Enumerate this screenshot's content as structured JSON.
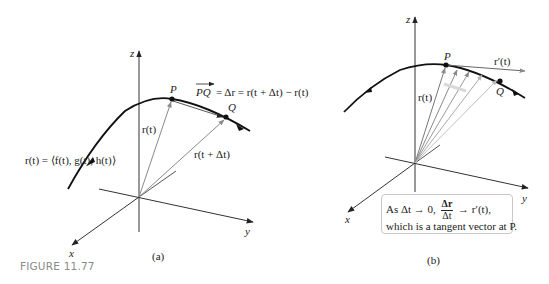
{
  "figure": {
    "caption": "FIGURE 11.77",
    "caption_color": "#8a8a8a",
    "panels": [
      {
        "id": "a",
        "sublabel": "(a)",
        "axes": {
          "x": "x",
          "y": "y",
          "z": "z"
        },
        "points": {
          "P": "P",
          "Q": "Q"
        },
        "labels": {
          "curve": "r(t) = ⟨f(t), g(t), h(t)⟩",
          "r_t": "r(t)",
          "r_t_dt": "r(t + Δt)",
          "pq_equation_lhs": "PQ",
          "pq_equation_rhs": "= Δr = r(t + Δt) − r(t)"
        }
      },
      {
        "id": "b",
        "sublabel": "(b)",
        "axes": {
          "x": "x",
          "y": "y",
          "z": "z"
        },
        "points": {
          "P": "P",
          "Q": "Q"
        },
        "labels": {
          "r_t": "r(t)",
          "r_prime": "r′(t)"
        },
        "note": {
          "line1_prefix": "As Δt → 0,",
          "frac_num": "Δr",
          "frac_den": "Δt",
          "line1_suffix": "→ r′(t),",
          "line2": "which is a tangent vector at P."
        }
      }
    ]
  }
}
